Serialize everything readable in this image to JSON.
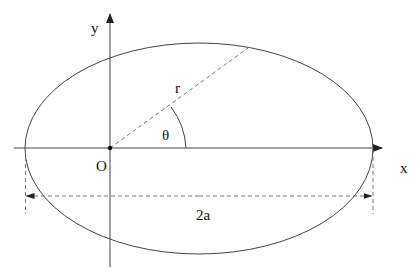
{
  "diagram": {
    "type": "ellipse-polar-coordinates",
    "labels": {
      "y_axis": "y",
      "x_axis": "x",
      "origin": "O",
      "radius": "r",
      "angle": "θ",
      "major_axis": "2a"
    },
    "colors": {
      "line": "#333333",
      "dashed": "#666666",
      "text": "#111111",
      "background": "#ffffff"
    }
  }
}
